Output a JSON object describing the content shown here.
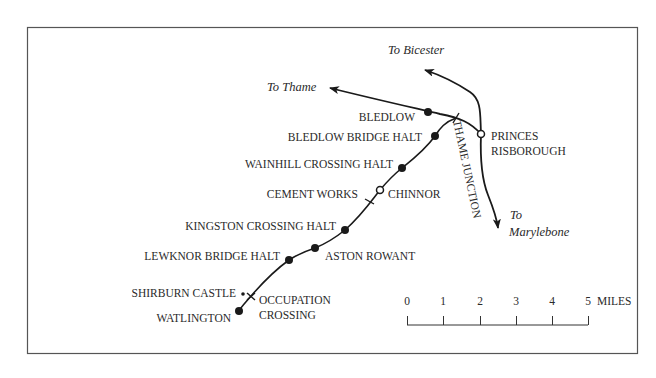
{
  "map": {
    "title": "Watlington branch line map",
    "line_color": "#1a1a1a",
    "directions": {
      "bicester": "To Bicester",
      "thame": "To Thame",
      "marylebone_line1": "To",
      "marylebone_line2": "Marylebone"
    },
    "junction_label": "THAME JUNCTION",
    "stations": [
      {
        "name": "BLEDLOW",
        "type": "station"
      },
      {
        "name": "BLEDLOW BRIDGE HALT",
        "type": "station"
      },
      {
        "name": "WAINHILL CROSSING HALT",
        "type": "station"
      },
      {
        "name": "CEMENT WORKS",
        "type": "siding"
      },
      {
        "name": "CHINNOR",
        "type": "open-station"
      },
      {
        "name": "KINGSTON CROSSING HALT",
        "type": "station"
      },
      {
        "name": "LEWKNOR BRIDGE HALT",
        "type": "station"
      },
      {
        "name": "ASTON ROWANT",
        "type": "station"
      },
      {
        "name": "SHIRBURN CASTLE",
        "type": "point"
      },
      {
        "name": "WATLINGTON",
        "type": "station"
      }
    ],
    "princes_risborough": {
      "line1": "PRINCES",
      "line2": "RISBOROUGH"
    },
    "occupation_crossing": {
      "line1": "OCCUPATION",
      "line2": "CROSSING"
    }
  },
  "scale": {
    "ticks": [
      "0",
      "1",
      "2",
      "3",
      "4",
      "5"
    ],
    "unit": "MILES"
  }
}
